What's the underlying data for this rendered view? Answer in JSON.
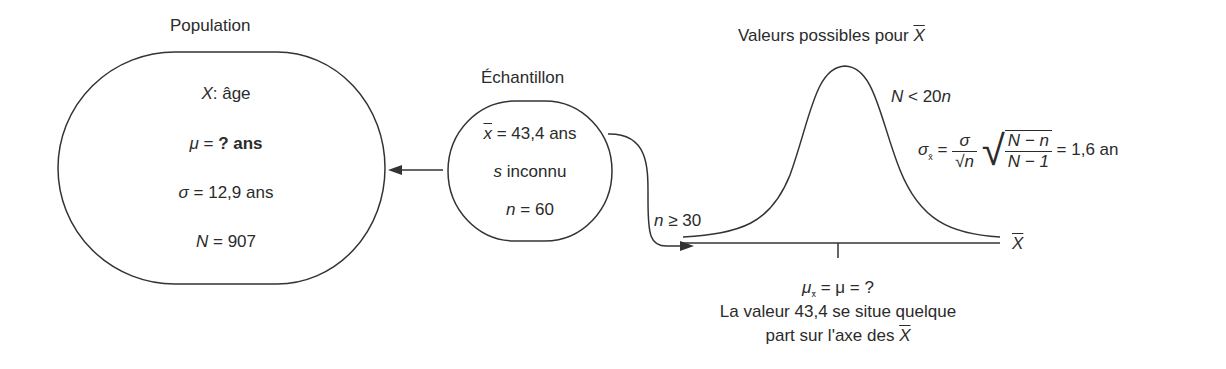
{
  "population": {
    "title": "Population",
    "variable_symbol": "X",
    "variable_label": ": âge",
    "mu_symbol": "μ",
    "mu_text": " = ",
    "mu_value": "? ans",
    "sigma_symbol": "σ",
    "sigma_text": " = 12,9 ans",
    "N_symbol": "N",
    "N_text": " = 907"
  },
  "sample": {
    "title": "Échantillon",
    "xbar_symbol": "x",
    "xbar_text": " = 43,4 ans",
    "s_symbol": "s",
    "s_text": " inconnu",
    "n_symbol": "n",
    "n_text": " = 60"
  },
  "condition_n": {
    "symbol": "n",
    "text": " ≥ 30"
  },
  "distribution": {
    "title": "Valeurs possibles pour ",
    "title_symbol": "X",
    "condition_N_symbol": "N",
    "condition_N_text": " < 20",
    "condition_N_n": "n",
    "sigma_symbol": "σ",
    "sigma_sub": "x̄",
    "eq": " = ",
    "frac_num": "σ",
    "frac_den": "√n",
    "root_num": "N − n",
    "root_den": "N − 1",
    "result": " = 1,6 an",
    "axis_label": "X",
    "mu_symbol": "μ",
    "mu_sub": "x̄",
    "mu_eq": " = μ = ?",
    "caption_line1": "La valeur 43,4 se situe quelque",
    "caption_line2": "part sur l'axe des ",
    "caption_symbol": "X"
  },
  "colors": {
    "stroke": "#333333",
    "text": "#2b2b2b"
  }
}
